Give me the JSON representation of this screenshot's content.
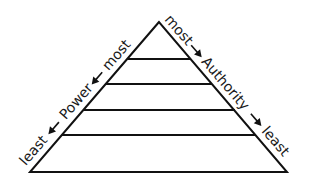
{
  "diagram": {
    "type": "pyramid",
    "levels": 5,
    "left_label": {
      "top": "most",
      "middle": "Power",
      "bottom": "least",
      "arrow_direction": "down-left"
    },
    "right_label": {
      "top": "most",
      "middle": "Authority",
      "bottom": "least",
      "arrow_direction": "down-right"
    },
    "colors": {
      "stroke": "#111111",
      "text": "#1a1a1a",
      "background": "#ffffff"
    }
  }
}
